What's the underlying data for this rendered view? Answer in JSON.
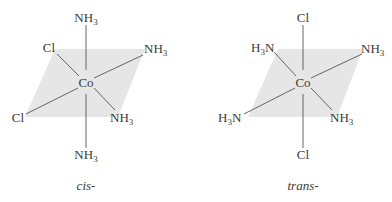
{
  "figures": [
    {
      "id": "cis",
      "caption": "cis-",
      "center": "Co",
      "ligands": {
        "top": "NH3",
        "bottom": "NH3",
        "upper_left": "Cl",
        "upper_right": "NH3",
        "lower_left": "Cl",
        "lower_right": "NH3"
      }
    },
    {
      "id": "trans",
      "caption": "trans-",
      "center": "Co",
      "ligands": {
        "top": "Cl",
        "bottom": "Cl",
        "upper_left": "H3N",
        "upper_right": "NH3",
        "lower_left": "H3N",
        "lower_right": "NH3"
      }
    }
  ],
  "colors": {
    "plane": "#e6e6e6",
    "bond": "#555555",
    "text": "#3a3a3a"
  }
}
